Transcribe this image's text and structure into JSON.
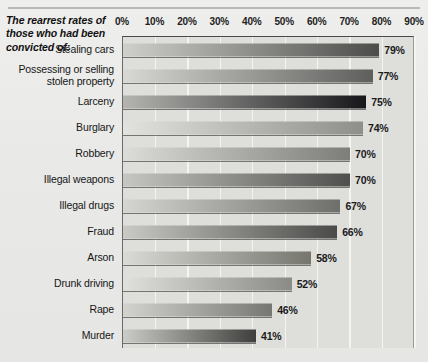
{
  "title": "The rearrest rates of those who had been convicted of:",
  "chart_data": {
    "type": "bar",
    "orientation": "horizontal",
    "title": "The rearrest rates of those who had been convicted of:",
    "xlabel": "",
    "ylabel": "",
    "xlim": [
      0,
      90
    ],
    "grid": true,
    "legend": "none",
    "tick_labels": [
      "0%",
      "10%",
      "20%",
      "30%",
      "40%",
      "50%",
      "60%",
      "70%",
      "80%",
      "90%"
    ],
    "ticks": [
      0,
      10,
      20,
      30,
      40,
      50,
      60,
      70,
      80,
      90
    ],
    "categories": [
      "Stealing cars",
      "Possessing or selling stolen property",
      "Larceny",
      "Burglary",
      "Robbery",
      "Illegal weapons",
      "Illegal drugs",
      "Fraud",
      "Arson",
      "Drunk driving",
      "Rape",
      "Murder"
    ],
    "values": [
      79,
      77,
      75,
      74,
      70,
      70,
      67,
      66,
      58,
      52,
      46,
      41
    ],
    "value_labels": [
      "79%",
      "77%",
      "75%",
      "74%",
      "70%",
      "70%",
      "67%",
      "66%",
      "58%",
      "52%",
      "46%",
      "41%"
    ],
    "bars": [
      {
        "label": "Stealing cars",
        "label_lines": [
          "Stealing cars"
        ],
        "value": 79,
        "value_label": "79%",
        "color_start": "#cfcfcb",
        "color_end": "#4c4c4a"
      },
      {
        "label": "Possessing or selling stolen property",
        "label_lines": [
          "Possessing or selling",
          "stolen property"
        ],
        "value": 77,
        "value_label": "77%",
        "color_start": "#d8d8d4",
        "color_end": "#5e5e5c"
      },
      {
        "label": "Larceny",
        "label_lines": [
          "Larceny"
        ],
        "value": 75,
        "value_label": "75%",
        "color_start": "#b4b4b0",
        "color_end": "#17171a"
      },
      {
        "label": "Burglary",
        "label_lines": [
          "Burglary"
        ],
        "value": 74,
        "value_label": "74%",
        "color_start": "#e2e2de",
        "color_end": "#8e8e8a"
      },
      {
        "label": "Robbery",
        "label_lines": [
          "Robbery"
        ],
        "value": 70,
        "value_label": "70%",
        "color_start": "#dcdcd8",
        "color_end": "#7d7d7a"
      },
      {
        "label": "Illegal weapons",
        "label_lines": [
          "Illegal weapons"
        ],
        "value": 70,
        "value_label": "70%",
        "color_start": "#c6c6c2",
        "color_end": "#4f4f4d"
      },
      {
        "label": "Illegal drugs",
        "label_lines": [
          "Illegal drugs"
        ],
        "value": 67,
        "value_label": "67%",
        "color_start": "#d5d5d1",
        "color_end": "#6e6e6b"
      },
      {
        "label": "Fraud",
        "label_lines": [
          "Fraud"
        ],
        "value": 66,
        "value_label": "66%",
        "color_start": "#c9c9c5",
        "color_end": "#4a4a48"
      },
      {
        "label": "Arson",
        "label_lines": [
          "Arson"
        ],
        "value": 58,
        "value_label": "58%",
        "color_start": "#dadad6",
        "color_end": "#76766f"
      },
      {
        "label": "Drunk driving",
        "label_lines": [
          "Drunk driving"
        ],
        "value": 52,
        "value_label": "52%",
        "color_start": "#e0e0dc",
        "color_end": "#8a8a86"
      },
      {
        "label": "Rape",
        "label_lines": [
          "Rape"
        ],
        "value": 46,
        "value_label": "46%",
        "color_start": "#d3d3cf",
        "color_end": "#767672"
      },
      {
        "label": "Murder",
        "label_lines": [
          "Murder"
        ],
        "value": 41,
        "value_label": "41%",
        "color_start": "#cbcbc7",
        "color_end": "#3f3f3d"
      }
    ]
  },
  "colors": {
    "figure_background": "#e9e9e7",
    "plot_background": "#dededa",
    "gridline": "#f4f4f1",
    "axis_line": "#4a4a48",
    "text": "#1a1a1a"
  }
}
